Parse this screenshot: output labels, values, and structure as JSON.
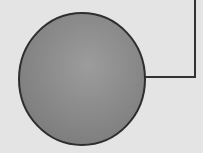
{
  "diagram": {
    "background_color": "#e4e4e4",
    "node": {
      "shape": "circle",
      "label": "",
      "cx": 82,
      "cy": 79,
      "rx": 63,
      "ry": 66,
      "fill_light": "#9a9a9a",
      "fill_dark": "#7e7e7e",
      "stroke": "#2e2e2e"
    },
    "connector": {
      "points": "145,77 195,77 195,0",
      "stroke": "#333333",
      "stroke_width": 2
    }
  }
}
